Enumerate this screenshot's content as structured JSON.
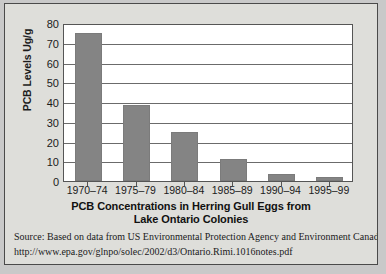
{
  "figure": {
    "background_color": "#dededa",
    "border_color": "#4a4a4a"
  },
  "chart_data": {
    "type": "bar",
    "title": "PCB Concentrations in Herring Gull Eggs from Lake Ontario Colonies",
    "title_line1": "PCB Concentrations in Herring Gull Eggs from",
    "title_line2": "Lake Ontario Colonies",
    "xlabel": "",
    "ylabel": "PCB Levels Ug/g",
    "categories": [
      "1970–74",
      "1975–79",
      "1980–84",
      "1985–89",
      "1990–94",
      "1995–99"
    ],
    "values": [
      75,
      38.5,
      25,
      11,
      3.5,
      2
    ],
    "ylim": [
      0,
      80
    ],
    "ytick_labels": [
      "0",
      "10",
      "20",
      "30",
      "40",
      "50",
      "60",
      "70",
      "80"
    ],
    "ytick_values": [
      0,
      10,
      20,
      30,
      40,
      50,
      60,
      70,
      80
    ],
    "grid": true,
    "grid_orientation": "horizontal",
    "legend": false,
    "bar_color": "#848484",
    "plot_background": "#ffffff",
    "axis_color": "#555555"
  },
  "source": {
    "line1": "Source: Based on data from US Environmental Protection Agency and Environment Canada, 2002.",
    "line2": "http://www.epa.gov/glnpo/solec/2002/d3/Ontario.Rimi.1016notes.pdf"
  }
}
